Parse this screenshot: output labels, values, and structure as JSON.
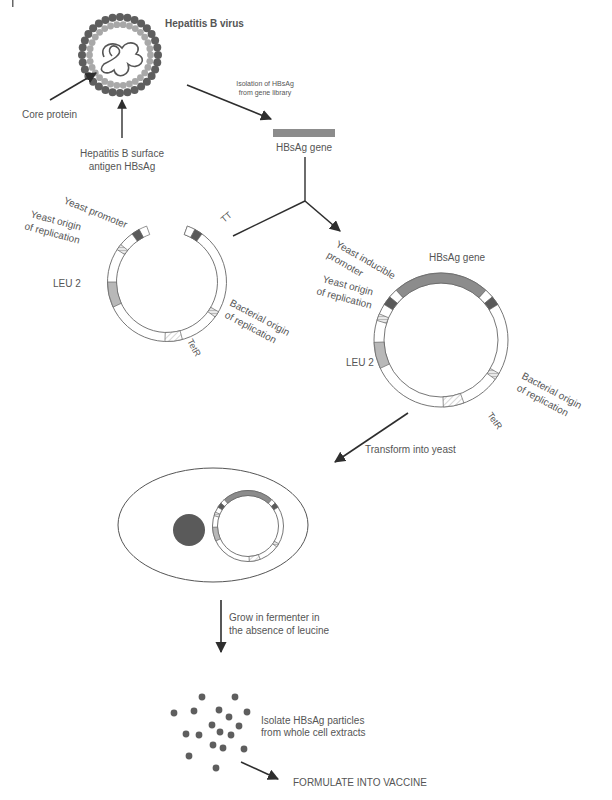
{
  "diagram": {
    "title": "Hepatitis B virus",
    "virus": {
      "label": "Hepatitis B virus",
      "core_label": "Core protein",
      "surface_label_line1": "Hepatitis B surface",
      "surface_label_line2": "antigen HBsAg"
    },
    "step1": {
      "line1": "Isolation of HBsAg",
      "line2": "from gene library"
    },
    "gene": {
      "label": "HBsAg gene"
    },
    "vector": {
      "yeast_promoter": "Yeast promoter",
      "yeast_origin_line1": "Yeast origin",
      "yeast_origin_line2": "of replication",
      "leu2": "LEU 2",
      "tt": "TT",
      "bacterial_origin_line1": "Bacterial origin",
      "bacterial_origin_line2": "of replication",
      "tetr": "TetR"
    },
    "recombinant": {
      "gene_label": "HBsAg gene",
      "inducible_line1": "Yeast inducible",
      "inducible_line2": "promoter",
      "yeast_origin_line1": "Yeast origin",
      "yeast_origin_line2": "of replication",
      "leu2": "LEU 2",
      "bacterial_origin_line1": "Bacterial origin",
      "bacterial_origin_line2": "of replication",
      "tetr": "TetR"
    },
    "step2": {
      "label": "Transform into yeast"
    },
    "step3": {
      "line1": "Grow in fermenter in",
      "line2": "the absence of leucine"
    },
    "step4": {
      "line1": "Isolate HBsAg particles",
      "line2": "from whole cell extracts"
    },
    "step5": {
      "label": "FORMULATE INTO VACCINE"
    },
    "colors": {
      "dark": "#5a5a5a",
      "medium": "#8c8c8c",
      "light": "#b8b8b8",
      "line": "#3a3a3a",
      "text": "#555555"
    }
  }
}
